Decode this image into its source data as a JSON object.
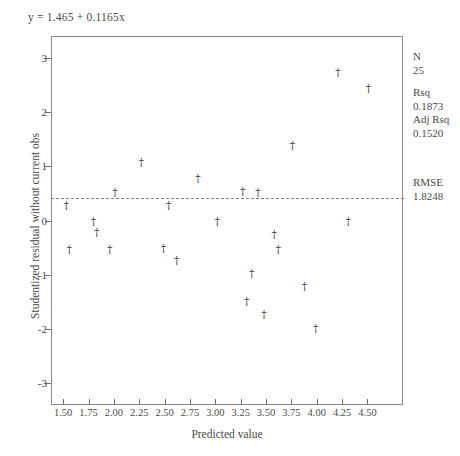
{
  "figure": {
    "equation": "y = 1.465 + 0.1165x",
    "xlabel": "Predicted value",
    "ylabel": "Studentized residual without current obs"
  },
  "stats": {
    "n_label": "N",
    "n_value": "25",
    "rsq_label": "Rsq",
    "rsq_value": "0.1873",
    "adj_rsq_label": "Adj Rsq",
    "adj_rsq_value": "0.1520",
    "rmse_label": "RMSE",
    "rmse_value": "1.8248"
  },
  "chart_data": {
    "type": "scatter",
    "title": "",
    "xlabel": "Predicted value",
    "ylabel": "Studentized residual without current obs",
    "xlim": [
      1.38,
      4.85
    ],
    "ylim": [
      -3.4,
      3.4
    ],
    "xticks": [
      "1.50",
      "1.75",
      "2.00",
      "2.25",
      "2.50",
      "2.75",
      "3.00",
      "3.25",
      "3.50",
      "3.75",
      "4.00",
      "4.25",
      "4.50"
    ],
    "xtick_values": [
      1.5,
      1.75,
      2.0,
      2.25,
      2.5,
      2.75,
      3.0,
      3.25,
      3.5,
      3.75,
      4.0,
      4.25,
      4.5
    ],
    "yticks": [
      "3",
      "2",
      "1",
      "0",
      "-1",
      "-2",
      "-3"
    ],
    "ytick_values": [
      3,
      2,
      1,
      0,
      -1,
      -2,
      -3
    ],
    "grid": false,
    "legend": "none",
    "marker": "dagger",
    "reference_line": {
      "type": "horizontal",
      "y": 0,
      "style": "dashed"
    },
    "fit_equation": "y = 1.465 + 0.1165x",
    "points": [
      {
        "x": 1.53,
        "y": 0.28
      },
      {
        "x": 1.56,
        "y": -0.52
      },
      {
        "x": 1.8,
        "y": 0.0
      },
      {
        "x": 1.83,
        "y": -0.22
      },
      {
        "x": 1.96,
        "y": -0.52
      },
      {
        "x": 2.01,
        "y": 0.52
      },
      {
        "x": 2.27,
        "y": 1.07
      },
      {
        "x": 2.49,
        "y": -0.51
      },
      {
        "x": 2.54,
        "y": 0.29
      },
      {
        "x": 2.62,
        "y": -0.72
      },
      {
        "x": 2.83,
        "y": 0.79
      },
      {
        "x": 3.02,
        "y": 0.0
      },
      {
        "x": 3.27,
        "y": 0.54
      },
      {
        "x": 3.31,
        "y": -1.49
      },
      {
        "x": 3.36,
        "y": -0.96
      },
      {
        "x": 3.42,
        "y": 0.52
      },
      {
        "x": 3.48,
        "y": -1.72
      },
      {
        "x": 3.58,
        "y": -0.24
      },
      {
        "x": 3.62,
        "y": -0.52
      },
      {
        "x": 3.76,
        "y": 1.4
      },
      {
        "x": 3.88,
        "y": -1.2
      },
      {
        "x": 3.99,
        "y": -1.98
      },
      {
        "x": 4.21,
        "y": 2.74
      },
      {
        "x": 4.31,
        "y": 0.0
      },
      {
        "x": 4.51,
        "y": 2.44
      }
    ]
  }
}
